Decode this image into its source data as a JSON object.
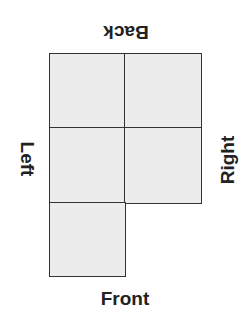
{
  "diagram": {
    "type": "net",
    "labels": {
      "back": "Back",
      "left": "Left",
      "right": "Right",
      "front": "Front"
    },
    "colors": {
      "cell_fill": "#ececec",
      "cell_border": "#333333",
      "text": "#222222"
    },
    "grid": {
      "rows": 3,
      "cols": 2,
      "filled_cells": [
        [
          0,
          0
        ],
        [
          0,
          1
        ],
        [
          1,
          0
        ],
        [
          1,
          1
        ],
        [
          2,
          0
        ]
      ]
    }
  }
}
